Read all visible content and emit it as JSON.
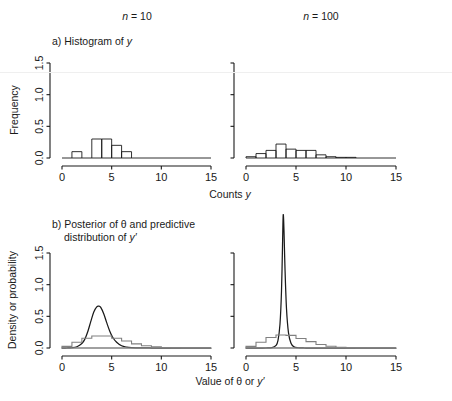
{
  "figure": {
    "columns": [
      {
        "id": "n10",
        "title_prefix": "n",
        "title_eq": " = ",
        "title_value": "10"
      },
      {
        "id": "n100",
        "title_prefix": "n",
        "title_eq": " = ",
        "title_value": "100"
      }
    ],
    "panel_a": {
      "label": "a) Histogram of ",
      "label_italic": "y",
      "ylabel": "Frequency",
      "xlabel_text": "Counts ",
      "xlabel_italic": "y"
    },
    "panel_b": {
      "label_line1": "b) Posterior of θ and predictive",
      "label_line2_text": "distribution of ",
      "label_line2_italic": "y′",
      "ylabel": "Density or probability",
      "xlabel_text": "Value of θ or ",
      "xlabel_italic": "y′"
    },
    "axes": {
      "x_ticks": [
        "0",
        "5",
        "10",
        "15"
      ],
      "x_tick_values": [
        0,
        5,
        10,
        15
      ],
      "xlim": [
        0,
        15
      ],
      "y_ticks": [
        "0.0",
        "0.5",
        "1.0",
        "1.5"
      ],
      "y_tick_values": [
        0.0,
        0.5,
        1.0,
        1.5
      ],
      "ylim": [
        0,
        1.5
      ]
    },
    "colors": {
      "ink": "#1a1a1a",
      "gray": "#808080",
      "background": "#ffffff"
    }
  },
  "chart_data": [
    {
      "id": "hist-n10",
      "type": "bar",
      "title": "a) Histogram of y  (n = 10)",
      "xlabel": "Counts y",
      "ylabel": "Frequency",
      "xlim": [
        0,
        15
      ],
      "ylim": [
        0,
        1.5
      ],
      "grid": false,
      "legend": "none",
      "bin_width": 1,
      "bin_starts": [
        0,
        1,
        2,
        3,
        4,
        5,
        6,
        7,
        8,
        9,
        10,
        11,
        12,
        13,
        14
      ],
      "values": [
        0.0,
        0.1,
        0.0,
        0.3,
        0.3,
        0.2,
        0.1,
        0.0,
        0.0,
        0.0,
        0.0,
        0.0,
        0.0,
        0.0,
        0.0
      ]
    },
    {
      "id": "hist-n100",
      "type": "bar",
      "title": "a) Histogram of y  (n = 100)",
      "xlabel": "Counts y",
      "ylabel": "Frequency",
      "xlim": [
        0,
        15
      ],
      "ylim": [
        0,
        1.5
      ],
      "grid": false,
      "legend": "none",
      "bin_width": 1,
      "bin_starts": [
        0,
        1,
        2,
        3,
        4,
        5,
        6,
        7,
        8,
        9,
        10,
        11,
        12,
        13,
        14
      ],
      "values": [
        0.02,
        0.07,
        0.12,
        0.22,
        0.14,
        0.12,
        0.12,
        0.05,
        0.02,
        0.01,
        0.01,
        0.0,
        0.0,
        0.0,
        0.0
      ]
    },
    {
      "id": "posterior-n10",
      "type": "line",
      "title": "b) Posterior of θ and predictive distribution of y′ (n = 10)",
      "xlabel": "Value of θ or y′",
      "ylabel": "Density or probability",
      "xlim": [
        0,
        15
      ],
      "ylim": [
        0,
        1.5
      ],
      "grid": false,
      "legend": "none",
      "series": [
        {
          "name": "posterior of θ",
          "style": "smooth-black",
          "peak_x": 3.7,
          "peak_y": 0.66,
          "x": [
            0.0,
            0.5,
            1.0,
            1.5,
            2.0,
            2.3,
            2.6,
            2.9,
            3.2,
            3.5,
            3.7,
            3.9,
            4.2,
            4.5,
            4.8,
            5.1,
            5.5,
            6.0,
            6.5,
            7.0,
            8.0,
            9.0,
            10.0,
            12.0,
            15.0
          ],
          "y": [
            0.0,
            0.0,
            0.004,
            0.02,
            0.07,
            0.14,
            0.26,
            0.42,
            0.57,
            0.65,
            0.66,
            0.64,
            0.54,
            0.4,
            0.27,
            0.17,
            0.09,
            0.035,
            0.014,
            0.006,
            0.001,
            0.0,
            0.0,
            0.0,
            0.0
          ]
        },
        {
          "name": "predictive distribution of y′",
          "style": "step-gray",
          "bin_width": 1,
          "bin_starts": [
            0,
            1,
            2,
            3,
            4,
            5,
            6,
            7,
            8,
            9,
            10,
            11,
            12,
            13,
            14
          ],
          "values": [
            0.025,
            0.09,
            0.155,
            0.19,
            0.19,
            0.155,
            0.11,
            0.065,
            0.035,
            0.018,
            0.008,
            0.003,
            0.001,
            0.0,
            0.0
          ]
        }
      ]
    },
    {
      "id": "posterior-n100",
      "type": "line",
      "title": "b) Posterior of θ and predictive distribution of y′ (n = 100)",
      "xlabel": "Value of θ or y′",
      "ylabel": "Density or probability",
      "xlim": [
        0,
        15
      ],
      "ylim": [
        0,
        1.5
      ],
      "grid": false,
      "legend": "none",
      "note": "posterior peak is clipped by the plot region",
      "series": [
        {
          "name": "posterior of θ",
          "style": "smooth-black",
          "peak_x": 3.72,
          "peak_y": 2.1,
          "x": [
            0.0,
            1.0,
            2.0,
            2.6,
            3.0,
            3.2,
            3.4,
            3.55,
            3.65,
            3.72,
            3.8,
            3.9,
            4.05,
            4.25,
            4.5,
            4.8,
            5.2,
            5.8,
            6.5,
            8.0,
            10.0,
            15.0
          ],
          "y": [
            0.0,
            0.0,
            0.0,
            0.005,
            0.04,
            0.12,
            0.38,
            0.9,
            1.6,
            2.1,
            1.85,
            1.25,
            0.62,
            0.24,
            0.075,
            0.018,
            0.004,
            0.0,
            0.0,
            0.0,
            0.0,
            0.0
          ]
        },
        {
          "name": "predictive distribution of y′",
          "style": "step-gray",
          "bin_width": 1,
          "bin_starts": [
            0,
            1,
            2,
            3,
            4,
            5,
            6,
            7,
            8,
            9,
            10,
            11,
            12,
            13,
            14
          ],
          "values": [
            0.025,
            0.09,
            0.165,
            0.205,
            0.2,
            0.15,
            0.1,
            0.055,
            0.027,
            0.012,
            0.005,
            0.002,
            0.0,
            0.0,
            0.0
          ]
        }
      ]
    }
  ]
}
